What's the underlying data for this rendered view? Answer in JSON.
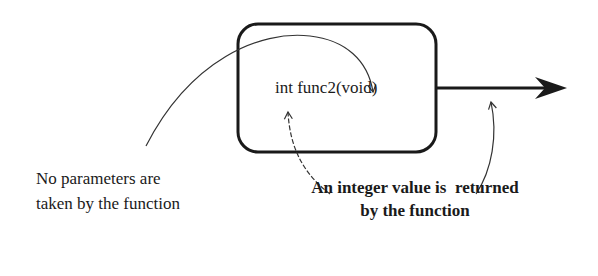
{
  "diagram": {
    "function_box": {
      "signature": "int func2(void)"
    },
    "annotations": {
      "parameters_line1": "No parameters are",
      "parameters_line2": "taken by the function",
      "return_line1": "An integer value is  returned",
      "return_line2": "by the function"
    },
    "colors": {
      "stroke": "#1a1a1a",
      "thin_stroke": "#333333",
      "background": "#ffffff"
    }
  }
}
